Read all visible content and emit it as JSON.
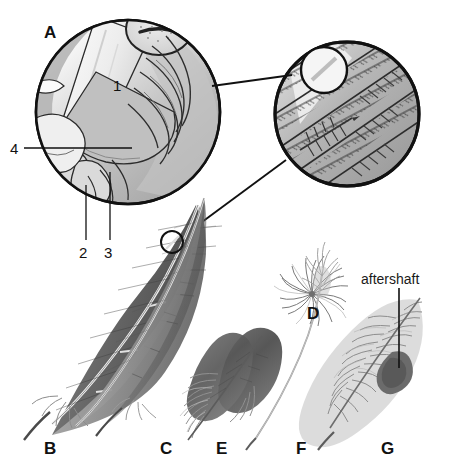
{
  "figure": {
    "background_color": "#ffffff",
    "ink_color": "#111111",
    "width": 455,
    "height": 469
  },
  "panel_a": {
    "panel_letter": "A",
    "description": "magnified cutaway circle of feather tract / follicle and shaft base",
    "callouts": [
      {
        "id": "1",
        "label": "1",
        "x": 113,
        "y": 85
      },
      {
        "id": "2",
        "label": "2",
        "x": 79,
        "y": 252
      },
      {
        "id": "3",
        "label": "3",
        "x": 104,
        "y": 252
      },
      {
        "id": "4",
        "label": "4",
        "x": 10,
        "y": 143
      }
    ]
  },
  "panel_magnifier": {
    "description": "enlarged circular inset showing barbs, barbules and hooklets of the vane",
    "inner_circle_label": "",
    "source_marker": "small circle on vane of feather B"
  },
  "specimens": [
    {
      "letter": "B",
      "label_x": 44,
      "label_y": 448,
      "name": "flight feather (remex)"
    },
    {
      "letter": "C",
      "label_x": 160,
      "label_y": 448,
      "name": "contour feather"
    },
    {
      "letter": "D",
      "label_x": 307,
      "label_y": 313,
      "name": "down feather (plumule)"
    },
    {
      "letter": "E",
      "label_x": 216,
      "label_y": 448,
      "name": "semiplume"
    },
    {
      "letter": "F",
      "label_x": 296,
      "label_y": 448,
      "name": "filoplume"
    },
    {
      "letter": "G",
      "label_x": 381,
      "label_y": 448,
      "name": "feather with aftershaft"
    }
  ],
  "annotations": [
    {
      "id": "aftershaft",
      "label": "aftershaft",
      "x": 393,
      "y": 281
    }
  ]
}
